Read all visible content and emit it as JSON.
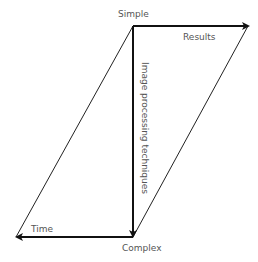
{
  "diagram": {
    "labels": {
      "simple": "Simple",
      "results": "Results",
      "time": "Time",
      "complex": "Complex",
      "vertical_axis": "Image processing techniques"
    },
    "colors": {
      "line": "#111111",
      "thin_line": "#222222",
      "text": "#555555",
      "background": "#ffffff"
    },
    "shape": "parallelogram",
    "arrows": [
      {
        "from": "Simple",
        "to": "Results",
        "direction": "right"
      },
      {
        "from": "Simple",
        "to": "Complex",
        "direction": "down"
      },
      {
        "from": "Complex",
        "to": "Time",
        "direction": "left"
      }
    ]
  }
}
